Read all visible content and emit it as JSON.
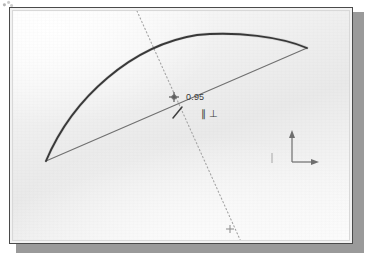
{
  "app": {
    "view_label": "CAD sketch viewport"
  },
  "sketch": {
    "dimension": {
      "value": "0.95",
      "x": 182,
      "y": 85
    },
    "constraints": [
      {
        "name": "parallel-constraint-symbol",
        "glyph": "∥"
      },
      {
        "name": "perpendicular-constraint-symbol",
        "glyph": "⊥"
      }
    ],
    "entities": {
      "arc": {
        "start": [
          42,
          157
        ],
        "apex": [
          193,
          31
        ],
        "end": [
          303,
          44
        ],
        "color": "#2b2b2b"
      },
      "chord": {
        "start": [
          42,
          157
        ],
        "end": [
          303,
          44
        ],
        "color": "#6b6b6b"
      },
      "construction_line": {
        "start": [
          133,
          9
        ],
        "end": [
          238,
          243
        ],
        "color": "#9a9a9a",
        "style": "dotted"
      },
      "intersection_point": [
        170,
        93
      ],
      "endpoint_marker": [
        227,
        225
      ]
    }
  },
  "axis_indicator": {
    "y_axis_label": "Y",
    "x_axis_label": "X",
    "origin": [
      288,
      158
    ],
    "color": "#6e6e6e"
  },
  "colors": {
    "frame_border": "#4a4a4a",
    "frame_shadow": "#9a9a9a",
    "canvas": "#eeeeee",
    "geometry_dark": "#2b2b2b",
    "geometry_light": "#6b6b6b"
  }
}
